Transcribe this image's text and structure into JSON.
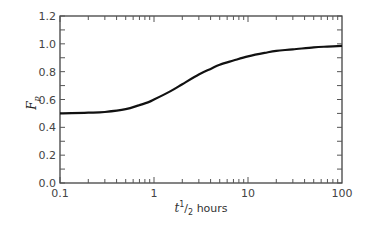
{
  "chart_data": {
    "type": "line",
    "title": "",
    "xlabel": "t^1/2 hours",
    "xlabel_parts": {
      "var": "t",
      "sup": "1",
      "slash": "/",
      "sub": "2",
      "unit": " hours"
    },
    "ylabel": "F_p",
    "ylabel_parts": {
      "var": "F",
      "sub": "p"
    },
    "xscale": "log",
    "xlim": [
      0.1,
      100
    ],
    "ylim": [
      0.0,
      1.2
    ],
    "grid": false,
    "legend": null,
    "x_ticks": [
      {
        "value": 0.1,
        "label": "0.1"
      },
      {
        "value": 1,
        "label": "1"
      },
      {
        "value": 10,
        "label": "10"
      },
      {
        "value": 100,
        "label": "100"
      }
    ],
    "y_ticks": [
      {
        "value": 0.0,
        "label": "0.0"
      },
      {
        "value": 0.2,
        "label": "0.2"
      },
      {
        "value": 0.4,
        "label": "0.4"
      },
      {
        "value": 0.6,
        "label": "0.6"
      },
      {
        "value": 0.8,
        "label": "0.8"
      },
      {
        "value": 1.0,
        "label": "1.0"
      },
      {
        "value": 1.2,
        "label": "1.2"
      }
    ],
    "series": [
      {
        "name": "F_p",
        "color": "#111111",
        "x": [
          0.1,
          0.2,
          0.3,
          0.5,
          0.7,
          0.9,
          1.0,
          1.5,
          2,
          3,
          4,
          5,
          7,
          10,
          15,
          20,
          30,
          50,
          70,
          100
        ],
        "y": [
          0.5,
          0.505,
          0.51,
          0.53,
          0.56,
          0.585,
          0.6,
          0.66,
          0.71,
          0.78,
          0.82,
          0.85,
          0.88,
          0.91,
          0.935,
          0.95,
          0.96,
          0.975,
          0.98,
          0.985
        ]
      }
    ]
  }
}
